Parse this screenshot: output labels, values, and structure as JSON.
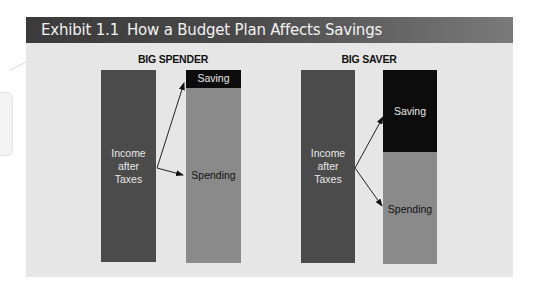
{
  "header": {
    "exhibit": "Exhibit 1.1",
    "title": "How a Budget Plan Affects Savings"
  },
  "groups": [
    {
      "title": "BIG SPENDER",
      "income_label": [
        "Income",
        "after",
        "Taxes"
      ],
      "saving_label": "Saving",
      "spending_label": "Spending"
    },
    {
      "title": "BIG SAVER",
      "income_label": [
        "Income",
        "after",
        "Taxes"
      ],
      "saving_label": "Saving",
      "spending_label": "Spending"
    }
  ],
  "colors": {
    "header": "#3a3a3a",
    "panel": "#e6e6e6",
    "income": "#4b4b4b",
    "spending": "#8a8a8a",
    "saving": "#0c0c0c"
  }
}
